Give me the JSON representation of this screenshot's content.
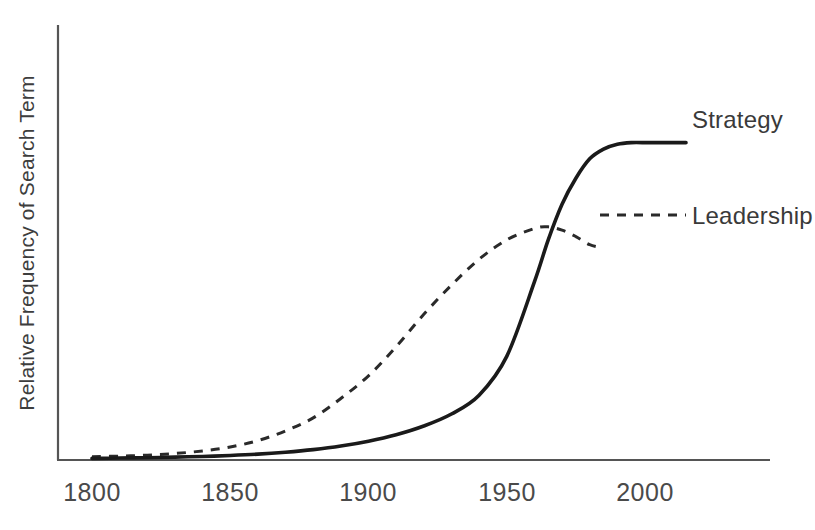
{
  "chart_data": {
    "type": "line",
    "title": "",
    "xlabel": "",
    "ylabel": "Relative Frequency of Search Term",
    "xlim": [
      1790,
      2010
    ],
    "ylim": [
      0,
      1.05
    ],
    "xticks": [
      "1800",
      "1850",
      "1900",
      "1950",
      "2000"
    ],
    "xtick_values": [
      1800,
      1850,
      1900,
      1950,
      2000
    ],
    "yticks": [],
    "grid": false,
    "legend_position": "inline-right-of-curve-ends",
    "x": [
      1800,
      1810,
      1820,
      1830,
      1840,
      1850,
      1860,
      1870,
      1880,
      1890,
      1900,
      1910,
      1920,
      1930,
      1940,
      1950,
      1960,
      1965,
      1970,
      1975,
      1980,
      1985,
      1990,
      1995,
      2000
    ],
    "series": [
      {
        "name": "Strategy",
        "style": "solid",
        "color": "#1a1a1a",
        "values": [
          0.005,
          0.006,
          0.007,
          0.009,
          0.011,
          0.014,
          0.018,
          0.024,
          0.032,
          0.043,
          0.058,
          0.078,
          0.105,
          0.142,
          0.2,
          0.32,
          0.55,
          0.68,
          0.79,
          0.87,
          0.93,
          0.96,
          0.975,
          0.98,
          0.98
        ]
      },
      {
        "name": "Leadership",
        "style": "dashed",
        "color": "#2a2a2a",
        "values": [
          0.01,
          0.012,
          0.015,
          0.02,
          0.028,
          0.04,
          0.06,
          0.09,
          0.13,
          0.19,
          0.26,
          0.35,
          0.45,
          0.54,
          0.62,
          0.68,
          0.715,
          0.72,
          0.71,
          0.69,
          0.665,
          0.655,
          0.65,
          0.65,
          0.65
        ]
      }
    ]
  },
  "labels": {
    "strategy": "Strategy",
    "leadership": "Leadership",
    "y_axis_title": "Relative Frequency of Search Term",
    "tick_1800": "1800",
    "tick_1850": "1850",
    "tick_1900": "1900",
    "tick_1950": "1950",
    "tick_2000": "2000"
  },
  "colors": {
    "background": "#ffffff",
    "axis": "#555555",
    "solid_series": "#1a1a1a",
    "dashed_series": "#2a2a2a",
    "text": "#3a3a3a",
    "tick_text": "#4a4a4a"
  }
}
